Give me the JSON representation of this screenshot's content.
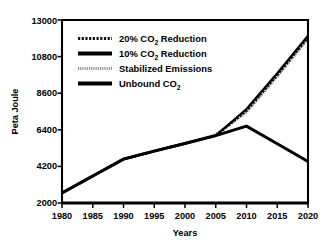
{
  "chart_data": {
    "type": "line",
    "title": "",
    "xlabel": "Years",
    "ylabel": "Peta Joule",
    "xlim": [
      1980,
      2020
    ],
    "ylim": [
      2000,
      13000
    ],
    "grid": false,
    "legend_position": "upper-left-inside",
    "x": [
      1980,
      1985,
      1990,
      1995,
      2000,
      2005,
      2010,
      2015,
      2020
    ],
    "xticks": [
      "1980",
      "1985",
      "1990",
      "1995",
      "2000",
      "2005",
      "2010",
      "2015",
      "2020"
    ],
    "yticks": [
      "2000",
      "4200",
      "6400",
      "8600",
      "10800",
      "13000"
    ],
    "series": [
      {
        "name": "20% CO2 Reduction",
        "label_main": "20% CO",
        "label_sub": "2",
        "label_tail": " Reduction",
        "style": "hatched",
        "values": [
          2600,
          3620,
          4640,
          5120,
          5580,
          6050,
          7550,
          9700,
          11950
        ]
      },
      {
        "name": "10% CO2 Reduction",
        "label_main": "10% CO",
        "label_sub": "2",
        "label_tail": " Reduction",
        "style": "solid",
        "values": [
          2600,
          3620,
          4640,
          5120,
          5580,
          6050,
          7650,
          9800,
          12050
        ]
      },
      {
        "name": "Stabilized Emissions",
        "label_main": "Stabilized Emissions",
        "label_sub": "",
        "label_tail": "",
        "style": "stippled",
        "values": [
          2600,
          3620,
          4640,
          5120,
          5580,
          6100,
          7480,
          9620,
          11880
        ]
      },
      {
        "name": "Unbound CO2",
        "label_main": "Unbound CO",
        "label_sub": "2",
        "label_tail": "",
        "style": "solid-thick",
        "values": [
          2600,
          3620,
          4640,
          5120,
          5580,
          6050,
          6620,
          5560,
          4500
        ]
      }
    ],
    "colors": {
      "axis": "#000000",
      "solid_line": "#000000",
      "stipple_line": "#7a7a7a",
      "background": "#ffffff"
    }
  },
  "legend": {
    "entries": [
      {
        "swatch": "hatched-swatch",
        "main": "20% CO",
        "sub": "2",
        "tail": " Reduction"
      },
      {
        "swatch": "solid-swatch",
        "main": "10% CO",
        "sub": "2",
        "tail": " Reduction"
      },
      {
        "swatch": "stippled-swatch",
        "main": "Stabilized Emissions",
        "sub": "",
        "tail": ""
      },
      {
        "swatch": "solid-swatch",
        "main": "Unbound CO",
        "sub": "2",
        "tail": ""
      }
    ]
  },
  "axes": {
    "x_title": "Years",
    "y_title": "Peta Joule",
    "x_tick_labels": [
      "1980",
      "1985",
      "1990",
      "1995",
      "2000",
      "2005",
      "2010",
      "2015",
      "2020"
    ],
    "y_tick_labels": [
      "2000",
      "4200",
      "6400",
      "8600",
      "10800",
      "13000"
    ]
  }
}
